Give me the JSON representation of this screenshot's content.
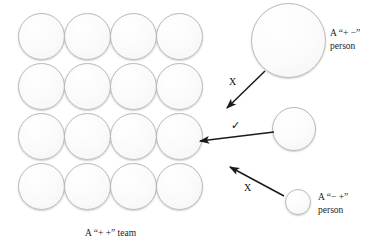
{
  "diagram": {
    "title_hidden": "",
    "background_color": "#ffffff",
    "circle_fill": "#fbfbfb",
    "circle_border": "#b9b9b9",
    "arrow_color": "#1a1a1a",
    "team": {
      "label": "A “+ +” team",
      "rows": 4,
      "columns": 4,
      "count": 16,
      "circle_diameter": 47,
      "origin_x": 18,
      "origin_y": 13,
      "step_x": 46,
      "step_y": 50
    },
    "people": [
      {
        "id": "plus-minus-person",
        "label_line1": "A “+ −”",
        "label_line2": "person",
        "diameter": 75,
        "x": 251,
        "y": 3,
        "label_x": 330,
        "label_y": 27
      },
      {
        "id": "neutral-person",
        "label_line1": "",
        "label_line2": "",
        "diameter": 44,
        "x": 272,
        "y": 107,
        "label_x": 0,
        "label_y": 0
      },
      {
        "id": "minus-plus-person",
        "label_line1": "A “− +”",
        "label_line2": "person",
        "diameter": 26,
        "x": 285,
        "y": 189,
        "label_x": 318,
        "label_y": 191
      }
    ],
    "arrows": [
      {
        "id": "arrow-top-rejected",
        "mark": "X",
        "mark_x": 229,
        "mark_y": 76,
        "x1": 265,
        "y1": 71,
        "x2": 227,
        "y2": 108
      },
      {
        "id": "arrow-middle-accepted",
        "mark": "✓",
        "mark_x": 231,
        "mark_y": 119,
        "x1": 274,
        "y1": 132,
        "x2": 200,
        "y2": 141
      },
      {
        "id": "arrow-bottom-rejected",
        "mark": "X",
        "mark_x": 244,
        "mark_y": 182,
        "x1": 284,
        "y1": 196,
        "x2": 230,
        "y2": 167
      }
    ],
    "team_label_x": 85,
    "team_label_y": 228
  }
}
